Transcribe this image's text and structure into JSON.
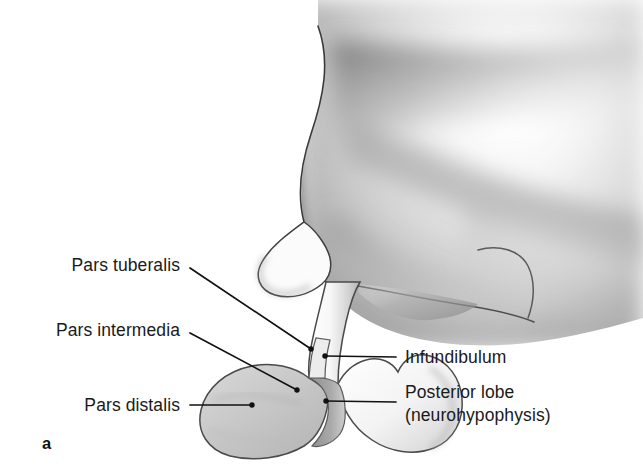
{
  "figure": {
    "panel_letter": "a",
    "background_color": "#ffffff",
    "ink_color": "#1a1a1a",
    "leader_color": "#111111",
    "pars_distalis_fill": "#c8c8c8",
    "posterior_lobe_fill": "#f2f2f2",
    "cleft_fill": "#9a9a9a",
    "brain_shading_color": "#8f8f8f"
  },
  "labels_left": [
    {
      "id": "pars-tuberalis",
      "text": "Pars tuberalis",
      "text_right_x": 180,
      "text_y": 265,
      "leader_start_x": 190,
      "leader_start_y": 268,
      "leader_end_x": 311,
      "leader_end_y": 349,
      "endpoint_dot": true
    },
    {
      "id": "pars-intermedia",
      "text": "Pars intermedia",
      "text_right_x": 180,
      "text_y": 330,
      "leader_start_x": 190,
      "leader_start_y": 333,
      "leader_end_x": 297,
      "leader_end_y": 390,
      "endpoint_dot": true
    },
    {
      "id": "pars-distalis",
      "text": "Pars distalis",
      "text_right_x": 180,
      "text_y": 405,
      "leader_start_x": 190,
      "leader_start_y": 405,
      "leader_end_x": 252,
      "leader_end_y": 405,
      "endpoint_dot": true
    }
  ],
  "labels_right": [
    {
      "id": "infundibulum",
      "lines": [
        "Infundibulum"
      ],
      "text_left_x": 405,
      "text_y": 357,
      "leader_start_x": 396,
      "leader_start_y": 357,
      "leader_end_x": 325,
      "leader_end_y": 356,
      "endpoint_dot": true
    },
    {
      "id": "posterior-lobe",
      "lines": [
        "Posterior lobe",
        "(neurohypophysis)"
      ],
      "text_left_x": 405,
      "text_y": 381,
      "leader_start_x": 396,
      "leader_start_y": 402,
      "leader_end_x": 326,
      "leader_end_y": 401,
      "endpoint_dot": true
    }
  ],
  "panel": {
    "letter_x": 42,
    "letter_y": 434
  }
}
